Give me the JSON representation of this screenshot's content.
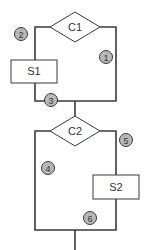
{
  "diagram": {
    "type": "control-flow-graph",
    "decisions": [
      {
        "id": "c1",
        "label": "C1"
      },
      {
        "id": "c2",
        "label": "C2"
      }
    ],
    "statements": [
      {
        "id": "s1",
        "label": "S1"
      },
      {
        "id": "s2",
        "label": "S2"
      }
    ],
    "edge_labels": [
      {
        "id": "e1",
        "label": "1"
      },
      {
        "id": "e2",
        "label": "2"
      },
      {
        "id": "e3",
        "label": "3"
      },
      {
        "id": "e4",
        "label": "4"
      },
      {
        "id": "e5",
        "label": "5"
      },
      {
        "id": "e6",
        "label": "6"
      }
    ],
    "colors": {
      "line": "#3a3a3a",
      "badge_fill": "#b8b8b8",
      "background": "#ffffff"
    }
  }
}
